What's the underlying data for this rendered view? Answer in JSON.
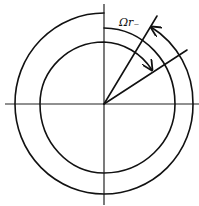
{
  "diagram": {
    "type": "rotating spiral / angular displacement diagram",
    "label": "Ωr₋",
    "center": [
      104,
      104
    ],
    "elements": [
      {
        "name": "horizontal-axis"
      },
      {
        "name": "vertical-axis"
      },
      {
        "name": "outer-spiral-arc",
        "arrow": "end"
      },
      {
        "name": "inner-spiral-arc",
        "arrow": "end"
      },
      {
        "name": "ray-steep"
      },
      {
        "name": "ray-shallow"
      }
    ],
    "colors": {
      "stroke": "#111111",
      "background": "#ffffff"
    }
  }
}
